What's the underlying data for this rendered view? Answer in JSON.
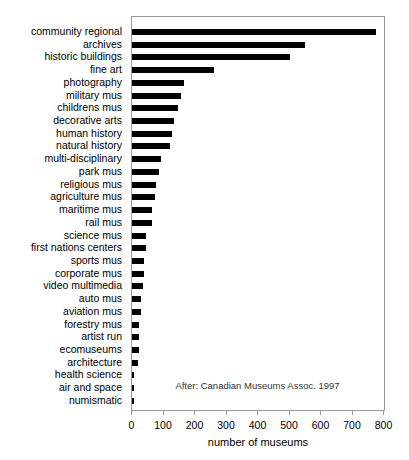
{
  "chart_data": {
    "type": "bar",
    "orientation": "horizontal",
    "title": "",
    "xlabel": "number of museums",
    "ylabel": "",
    "xlim": [
      0,
      800
    ],
    "xticks": [
      0,
      100,
      200,
      300,
      400,
      500,
      600,
      700,
      800
    ],
    "grid": false,
    "legend_position": "none",
    "bar_color": "#000000",
    "frame_color": "#9a9a9a",
    "annotation": "After: Canadian Museums Assoc. 1997",
    "categories": [
      "community regional",
      "archives",
      "historic buildings",
      "fine art",
      "photography",
      "military mus",
      "childrens mus",
      "decorative arts",
      "human history",
      "natural history",
      "multi-disciplinary",
      "park mus",
      "religious mus",
      "agriculture mus",
      "maritime mus",
      "rail mus",
      "science mus",
      "first nations centers",
      "sports mus",
      "corporate mus",
      "video multimedia",
      "auto mus",
      "aviation mus",
      "forestry mus",
      "artist run",
      "ecomuseums",
      "architecture",
      "health science",
      "air and space",
      "numismatic"
    ],
    "values": [
      775,
      548,
      500,
      260,
      165,
      155,
      145,
      132,
      128,
      121,
      93,
      86,
      75,
      73,
      62,
      62,
      46,
      45,
      38,
      38,
      36,
      30,
      30,
      23,
      23,
      22,
      18,
      5,
      5,
      4
    ]
  }
}
